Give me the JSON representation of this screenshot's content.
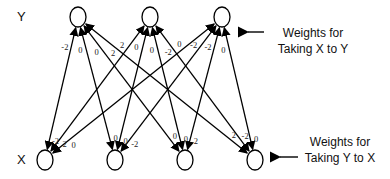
{
  "layers": {
    "y": {
      "label": "Y",
      "nodes": [
        {
          "id": "y1",
          "cx": 78,
          "cy": 17
        },
        {
          "id": "y2",
          "cx": 150,
          "cy": 17
        },
        {
          "id": "y3",
          "cx": 222,
          "cy": 17
        }
      ]
    },
    "x": {
      "label": "X",
      "nodes": [
        {
          "id": "x1",
          "cx": 45,
          "cy": 160
        },
        {
          "id": "x2",
          "cx": 115,
          "cy": 160
        },
        {
          "id": "x3",
          "cx": 185,
          "cy": 160
        },
        {
          "id": "x4",
          "cx": 255,
          "cy": 160
        }
      ]
    }
  },
  "annotations": {
    "x_to_y": {
      "line1": "Weights for",
      "line2": "Taking X to Y"
    },
    "y_to_x": {
      "line1": "Weights for",
      "line2": "Taking Y to X"
    }
  },
  "edges": [
    {
      "from": "y1",
      "to": "x1",
      "w_xy": "-2",
      "w_yx": "-2"
    },
    {
      "from": "y1",
      "to": "x2",
      "w_xy": "0",
      "w_yx": "0"
    },
    {
      "from": "y1",
      "to": "x3",
      "w_xy": "0",
      "w_yx": "0"
    },
    {
      "from": "y1",
      "to": "x4",
      "w_xy": "2",
      "w_yx": "2"
    },
    {
      "from": "y2",
      "to": "x1",
      "w_xy": "2",
      "w_yx": "2"
    },
    {
      "from": "y2",
      "to": "x2",
      "w_xy": "0",
      "w_yx": "0"
    },
    {
      "from": "y2",
      "to": "x3",
      "w_xy": "0",
      "w_yx": "0"
    },
    {
      "from": "y2",
      "to": "x4",
      "w_xy": "-2",
      "w_yx": "-2"
    },
    {
      "from": "y3",
      "to": "x1",
      "w_xy": "0",
      "w_yx": "0"
    },
    {
      "from": "y3",
      "to": "x2",
      "w_xy": "-2",
      "w_yx": "-2"
    },
    {
      "from": "y3",
      "to": "x3",
      "w_xy": "-2",
      "w_yx": "2"
    },
    {
      "from": "y3",
      "to": "x4",
      "w_xy": "0",
      "w_yx": "0"
    }
  ]
}
